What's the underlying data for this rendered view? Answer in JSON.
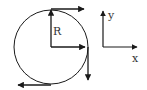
{
  "diagram": {
    "labels": {
      "radius": "R",
      "x_axis": "x",
      "y_axis": "y"
    },
    "colors": {
      "stroke": "#1a1a1a",
      "background": "#ffffff"
    },
    "vectors": [
      {
        "name": "radius-vector",
        "direction": "up",
        "from": "center",
        "to": "top of circle"
      },
      {
        "name": "radial-right-vector",
        "direction": "right",
        "from": "center",
        "to": "right of circle"
      },
      {
        "name": "tangent-top-vector",
        "direction": "right",
        "at": "top of circle"
      },
      {
        "name": "tangent-right-vector",
        "direction": "down",
        "at": "right of circle"
      },
      {
        "name": "tangent-bottom-vector",
        "direction": "left",
        "at": "bottom of circle"
      }
    ]
  }
}
